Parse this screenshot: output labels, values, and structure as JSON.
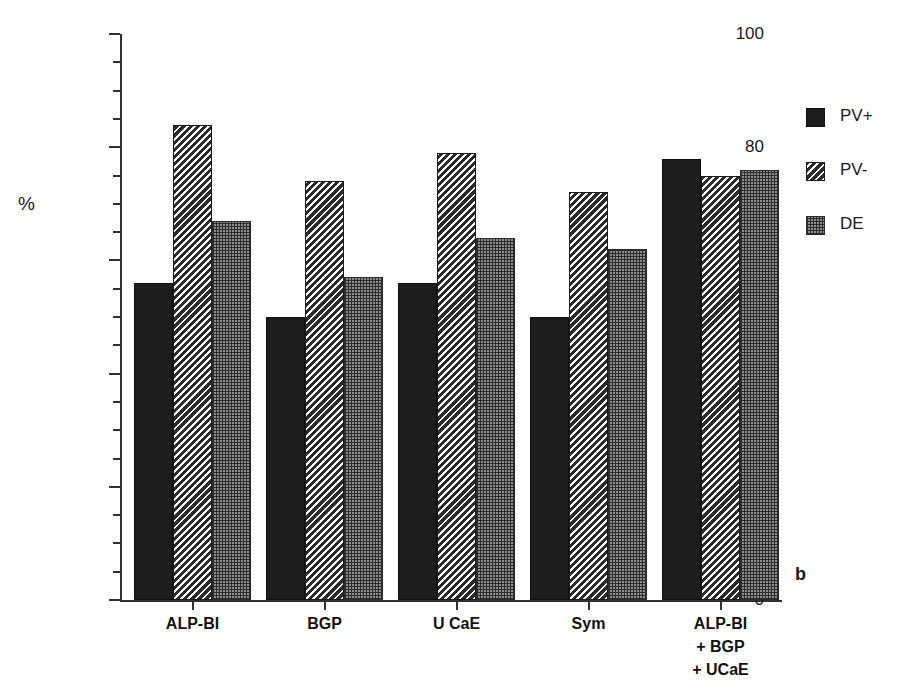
{
  "figure": {
    "panel_letter": "b",
    "ylabel": "%"
  },
  "legend": {
    "position": "right",
    "items": [
      {
        "label": "PV+",
        "pattern": "solid-black",
        "color": "#1d1d1d"
      },
      {
        "label": "PV-",
        "pattern": "diagonal-hatch",
        "color": "#3a3a3a"
      },
      {
        "label": "DE",
        "pattern": "checker-dot",
        "color": "#8d8d8d"
      }
    ]
  },
  "chart_data": {
    "type": "bar",
    "title": "",
    "subtitle": "",
    "xlabel": "",
    "ylabel": "%",
    "ylim": [
      0,
      100
    ],
    "ytick_step": 20,
    "yminor_step": 5,
    "ytick_labels": [
      "0",
      "20",
      "40",
      "60",
      "80",
      "100"
    ],
    "grid": false,
    "legend_position": "right",
    "categories": [
      "ALP-BI",
      "BGP",
      "U CaE",
      "Sym",
      "ALP-BI\n+ BGP\n+ UCaE"
    ],
    "series": [
      {
        "name": "PV+",
        "values": [
          56,
          50,
          56,
          50,
          78
        ]
      },
      {
        "name": "PV-",
        "values": [
          84,
          74,
          79,
          72,
          75
        ]
      },
      {
        "name": "DE",
        "values": [
          67,
          57,
          64,
          62,
          76
        ]
      }
    ]
  }
}
